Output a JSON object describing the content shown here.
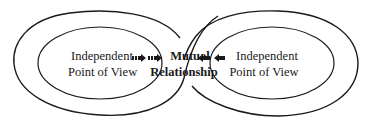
{
  "diagram": {
    "left": {
      "line1": "Independent",
      "line2": "Point of View"
    },
    "center": {
      "line1": "Mutual",
      "line2": "Relationship"
    },
    "right": {
      "line1": "Independent",
      "line2": "Point of View"
    },
    "arrows": {
      "left_to_center": "arrow-right-icon",
      "right_to_center": "arrow-left-icon"
    },
    "colors": {
      "stroke": "#1a1a1a",
      "background": "#ffffff"
    }
  }
}
